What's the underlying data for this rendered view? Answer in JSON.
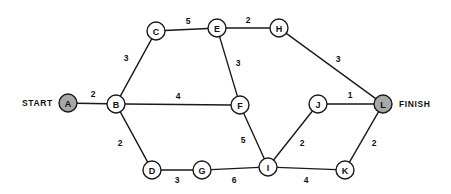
{
  "diagram": {
    "type": "weighted-undirected-network-graph",
    "width": 451,
    "height": 194,
    "background_color": "#ffffff",
    "line_color": "#1a1a1a",
    "node_fill_color": "#ffffff",
    "terminal_node_fill_color": "#a8a8a8",
    "node_radius": 9,
    "terminal_labels": {
      "start": "START",
      "finish": "FINISH"
    },
    "nodes": [
      {
        "id": "A",
        "label": "A",
        "x": 68,
        "y": 103,
        "shaded": true
      },
      {
        "id": "B",
        "label": "B",
        "x": 116,
        "y": 104,
        "shaded": false
      },
      {
        "id": "C",
        "label": "C",
        "x": 156,
        "y": 31,
        "shaded": false
      },
      {
        "id": "D",
        "label": "D",
        "x": 152,
        "y": 170,
        "shaded": false
      },
      {
        "id": "E",
        "label": "E",
        "x": 217,
        "y": 28,
        "shaded": false
      },
      {
        "id": "F",
        "label": "F",
        "x": 240,
        "y": 105,
        "shaded": false
      },
      {
        "id": "G",
        "label": "G",
        "x": 202,
        "y": 170,
        "shaded": false
      },
      {
        "id": "H",
        "label": "H",
        "x": 279,
        "y": 28,
        "shaded": false
      },
      {
        "id": "I",
        "label": "I",
        "x": 268,
        "y": 167,
        "shaded": false
      },
      {
        "id": "J",
        "label": "J",
        "x": 318,
        "y": 104,
        "shaded": false
      },
      {
        "id": "K",
        "label": "K",
        "x": 345,
        "y": 170,
        "shaded": false
      },
      {
        "id": "L",
        "label": "L",
        "x": 383,
        "y": 104,
        "shaded": true
      }
    ],
    "edges": [
      {
        "from": "A",
        "to": "B",
        "weight": "2",
        "lx": 93,
        "ly": 94
      },
      {
        "from": "B",
        "to": "C",
        "weight": "3",
        "lx": 126,
        "ly": 58
      },
      {
        "from": "B",
        "to": "F",
        "weight": "4",
        "lx": 178,
        "ly": 96
      },
      {
        "from": "B",
        "to": "D",
        "weight": "2",
        "lx": 120,
        "ly": 143
      },
      {
        "from": "C",
        "to": "E",
        "weight": "5",
        "lx": 188,
        "ly": 21
      },
      {
        "from": "E",
        "to": "H",
        "weight": "2",
        "lx": 248,
        "ly": 20
      },
      {
        "from": "E",
        "to": "F",
        "weight": "3",
        "lx": 238,
        "ly": 63
      },
      {
        "from": "H",
        "to": "L",
        "weight": "3",
        "lx": 338,
        "ly": 59
      },
      {
        "from": "F",
        "to": "I",
        "weight": "5",
        "lx": 243,
        "ly": 140
      },
      {
        "from": "D",
        "to": "G",
        "weight": "3",
        "lx": 177,
        "ly": 180
      },
      {
        "from": "G",
        "to": "I",
        "weight": "6",
        "lx": 234,
        "ly": 180
      },
      {
        "from": "I",
        "to": "J",
        "weight": "2",
        "lx": 302,
        "ly": 143
      },
      {
        "from": "I",
        "to": "K",
        "weight": "4",
        "lx": 306,
        "ly": 180
      },
      {
        "from": "J",
        "to": "L",
        "weight": "1",
        "lx": 350,
        "ly": 95
      },
      {
        "from": "K",
        "to": "L",
        "weight": "2",
        "lx": 374,
        "ly": 143
      }
    ],
    "start_label_pos": {
      "x": 22,
      "y": 103
    },
    "finish_label_pos": {
      "x": 399,
      "y": 104
    }
  }
}
